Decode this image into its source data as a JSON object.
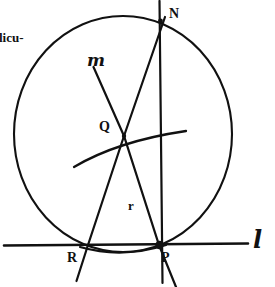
{
  "figure": {
    "caption_fragment": "licu-",
    "ink_color": "#111111",
    "background_color": "#ffffff",
    "labels": {
      "point_n": "N",
      "point_q": "Q",
      "point_r": "R",
      "point_p": "P",
      "segment_r": "r",
      "line_m": "m",
      "line_l": "l"
    },
    "geometry": {
      "circle": {
        "cx": 123,
        "cy": 134,
        "rx": 109,
        "ry": 118
      },
      "line_l": {
        "x1": 4,
        "y1": 245,
        "x2": 248,
        "y2": 243
      },
      "line_through_n_p": {
        "x1": 160,
        "y1": 2,
        "x2": 162,
        "y2": 283
      },
      "line_through_n_r": {
        "x1": 164,
        "y1": 20,
        "x2": 76,
        "y2": 281
      },
      "line_m_through_q_p": {
        "x1": 93,
        "y1": 68,
        "x2": 176,
        "y2": 287
      },
      "arc_through_q": {
        "x1": 74,
        "y1": 167,
        "x2": 186,
        "y2": 131
      },
      "arc_below_l": {
        "x1": 80,
        "y1": 248,
        "x2": 166,
        "y2": 246
      },
      "point_q_dot": {
        "x": 124,
        "y": 136
      },
      "point_p_dot": {
        "x": 159,
        "y": 245
      },
      "point_n_dot": {
        "x": 160,
        "y": 21
      },
      "point_r_dot": {
        "x": 88,
        "y": 245
      }
    }
  }
}
